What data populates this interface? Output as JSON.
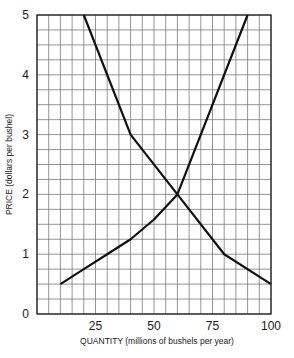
{
  "chart_data": {
    "type": "line",
    "title": "",
    "xlabel": "QUANTITY (millions of bushels per year)",
    "ylabel": "PRICE (dollars per bushel)",
    "xlim": [
      0,
      100
    ],
    "ylim": [
      0,
      5
    ],
    "x_ticks": [
      25,
      50,
      75,
      100
    ],
    "y_ticks": [
      0,
      1,
      2,
      3,
      4,
      5
    ],
    "grid": true,
    "grid_step_x": 5,
    "grid_step_y": 0.25,
    "legend": "none",
    "series": [
      {
        "name": "Demand",
        "points": [
          [
            20,
            5
          ],
          [
            40,
            3
          ],
          [
            60,
            2
          ],
          [
            80,
            1
          ],
          [
            100,
            0.5
          ]
        ]
      },
      {
        "name": "Supply",
        "points": [
          [
            10,
            0.5
          ],
          [
            20,
            0.75
          ],
          [
            30,
            1.0
          ],
          [
            40,
            1.25
          ],
          [
            50,
            1.58
          ],
          [
            60,
            2.0
          ],
          [
            70,
            3.0
          ],
          [
            80,
            4.0
          ],
          [
            90,
            5.0
          ]
        ]
      }
    ]
  },
  "colors": {
    "grid": "#7a7a7a",
    "axis": "#222222",
    "curve": "#111111"
  }
}
